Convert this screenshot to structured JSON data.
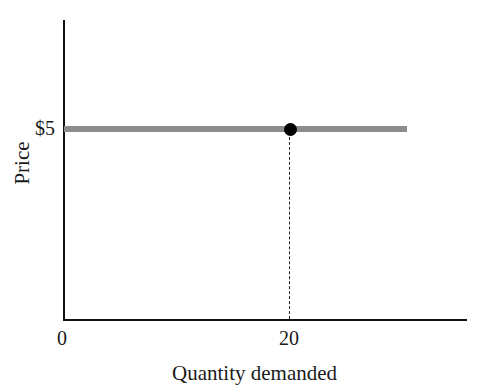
{
  "chart_data": {
    "type": "line",
    "title": "",
    "xlabel": "Quantity demanded",
    "ylabel": "Price",
    "x_ticks": [
      "0",
      "20"
    ],
    "y_ticks": [
      "$5"
    ],
    "xlim": [
      0,
      30
    ],
    "ylim": [
      0,
      8.5
    ],
    "grid": false,
    "legend": null,
    "series": [
      {
        "name": "Horizontal price line (perfectly elastic demand)",
        "color": "#8c8c8c",
        "style": "solid-thick",
        "x": [
          0,
          30.5
        ],
        "y": [
          5,
          5
        ]
      }
    ],
    "points": [
      {
        "x": 20,
        "y": 5,
        "color": "#000000",
        "marker": "filled-circle"
      }
    ],
    "annotations": [
      {
        "type": "dashed-vertical-line",
        "x": 20,
        "from_y": 0,
        "to_y": 5
      }
    ]
  },
  "labels": {
    "y_tick": "$5",
    "x_tick_0": "0",
    "x_tick_20": "20",
    "x_axis_title": "Quantity demanded",
    "y_axis_title": "Price"
  }
}
